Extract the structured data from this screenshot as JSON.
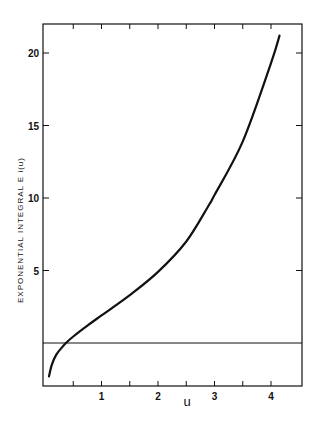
{
  "chart_data": {
    "type": "line",
    "title": "",
    "xlabel": "u",
    "ylabel": "EXPONENTIAL INTEGRAL Ei(u)",
    "xlim": [
      0,
      4.6
    ],
    "ylim": [
      -3,
      22.5
    ],
    "x_ticks_labeled": [
      1,
      2,
      3,
      4
    ],
    "x_ticks_minor": [
      0.5,
      1.5,
      2.5,
      3.5
    ],
    "y_ticks_labeled": [
      5,
      10,
      15,
      20
    ],
    "grid": false,
    "legend": null,
    "reference_line": {
      "y": 0,
      "style": "horizontal thin line"
    },
    "series": [
      {
        "name": "Ei(u)",
        "x": [
          0.07,
          0.12,
          0.2,
          0.3,
          0.37,
          0.5,
          0.75,
          1.0,
          1.5,
          2.0,
          2.5,
          2.9,
          3.0,
          3.5,
          4.0,
          4.15
        ],
        "y": [
          -2.3,
          -1.5,
          -0.8,
          -0.3,
          0.0,
          0.45,
          1.2,
          1.9,
          3.3,
          4.9,
          7.0,
          9.5,
          10.2,
          13.9,
          19.3,
          21.2
        ]
      }
    ]
  },
  "labels": {
    "y_axis": "EXPONENTIAL INTEGRAL  E i(u)",
    "x_axis": "u",
    "x_ticks": [
      "1",
      "2",
      "3",
      "4"
    ],
    "y_ticks": [
      "5",
      "10",
      "15",
      "20"
    ]
  }
}
